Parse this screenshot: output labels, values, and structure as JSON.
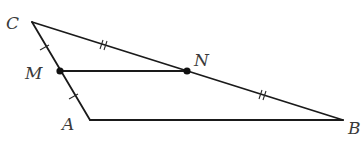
{
  "diagram": {
    "type": "triangle-midsegment",
    "stroke_color": "#1a1a1a",
    "label_color": "#3a3a3a",
    "points": {
      "C": {
        "label": "C",
        "x": 32,
        "y": 22
      },
      "M": {
        "label": "M",
        "x": 60,
        "y": 71
      },
      "N": {
        "label": "N",
        "x": 187,
        "y": 71
      },
      "A": {
        "label": "A",
        "x": 90,
        "y": 120
      },
      "B": {
        "label": "B",
        "x": 343,
        "y": 120
      }
    },
    "segments": [
      {
        "from": "C",
        "to": "A",
        "name": "side-CA"
      },
      {
        "from": "C",
        "to": "B",
        "name": "side-CB"
      },
      {
        "from": "A",
        "to": "B",
        "name": "side-AB"
      },
      {
        "from": "M",
        "to": "N",
        "name": "segment-MN"
      }
    ],
    "tick_marks": [
      {
        "segment": "CM",
        "count": 1
      },
      {
        "segment": "MA",
        "count": 1
      },
      {
        "segment": "CN",
        "count": 2
      },
      {
        "segment": "NB",
        "count": 2
      }
    ],
    "labels": {
      "C": "C",
      "M": "M",
      "N": "N",
      "A": "A",
      "B": "B"
    }
  }
}
